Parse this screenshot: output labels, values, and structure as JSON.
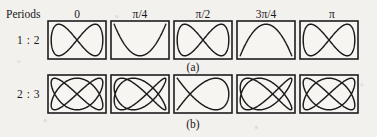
{
  "figure": {
    "title_row_label": "Periods",
    "phase_headers": [
      "0",
      "π/4",
      "π/2",
      "3π/4",
      "π"
    ],
    "row_labels": [
      "1 : 2",
      "2 : 3"
    ],
    "captions": [
      "(a)",
      "(b)"
    ],
    "colors": {
      "background": "#f3f1ee",
      "panel_fill": "#f7f5f2",
      "ink": "#1b1b1b",
      "frame": "#1d1d1d"
    }
  },
  "chart_data": {
    "type": "line",
    "xlabel": "",
    "ylabel": "",
    "grid": false,
    "legend": null,
    "xlim": [
      -1,
      1
    ],
    "ylim": [
      -1,
      1
    ],
    "parametric": true,
    "x_formula": "sin(a*t + delta)",
    "y_formula": "sin(b*t)",
    "phase_headers": [
      "0",
      "π/4",
      "π/2",
      "3π/4",
      "π"
    ],
    "phase_values": [
      0,
      0.7853981634,
      1.5707963268,
      2.3561944902,
      3.1415926536
    ],
    "rows": [
      {
        "label": "1 : 2",
        "caption": "(a)",
        "freq_x": 1,
        "freq_y": 2,
        "panels": [
          {
            "phase_label": "0",
            "phase": 0,
            "shape": "two stacked horizontal lobes"
          },
          {
            "phase_label": "π/4",
            "phase": 0.7853981634,
            "shape": "open crossing loop, crossing right of centre"
          },
          {
            "phase_label": "π/2",
            "phase": 1.5707963268,
            "shape": "single parabola-like arc opening left"
          },
          {
            "phase_label": "3π/4",
            "phase": 2.3561944902,
            "shape": "open crossing loop, mirrored"
          },
          {
            "phase_label": "π",
            "phase": 3.1415926536,
            "shape": "two stacked horizontal lobes"
          }
        ]
      },
      {
        "label": "2 : 3",
        "caption": "(b)",
        "freq_x": 2,
        "freq_y": 3,
        "panels": [
          {
            "phase_label": "0",
            "phase": 0,
            "shape": "woven lattice, multiple crossings"
          },
          {
            "phase_label": "π/4",
            "phase": 0.7853981634,
            "shape": "woven lattice, shifted weave"
          },
          {
            "phase_label": "π/2",
            "phase": 1.5707963268,
            "shape": "large ellipse with lower crossing"
          },
          {
            "phase_label": "3π/4",
            "phase": 2.3561944902,
            "shape": "woven lattice, mirrored weave"
          },
          {
            "phase_label": "π",
            "phase": 3.1415926536,
            "shape": "woven lattice, multiple crossings"
          }
        ]
      }
    ]
  },
  "layout": {
    "panel_width": 58,
    "panel_height": 38,
    "panel_gap": 5,
    "first_panel_x": 48,
    "row1_y": 21,
    "row2_y": 75
  }
}
